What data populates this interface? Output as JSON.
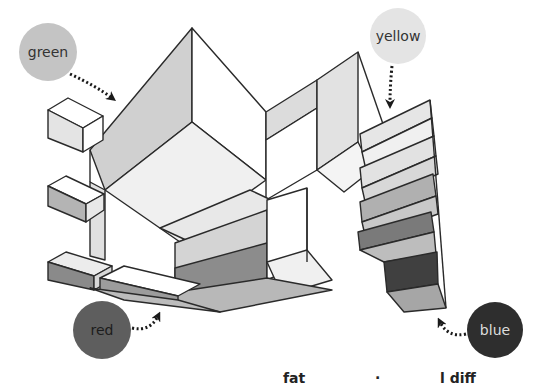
{
  "diagram": {
    "title": "",
    "style": "isometric grayscale block structure",
    "callouts": [
      {
        "id": "green",
        "label": "green",
        "x": 48,
        "y": 52,
        "r": 29,
        "fill": "#c4c4c4",
        "text_color": "#333333",
        "arrow_target": "large front face of main block"
      },
      {
        "id": "yellow",
        "label": "yellow",
        "x": 398,
        "y": 36,
        "r": 28,
        "fill": "#e4e4e4",
        "text_color": "#333333",
        "arrow_target": "top slabs of right staircase"
      },
      {
        "id": "red",
        "label": "red",
        "x": 102,
        "y": 330,
        "r": 29,
        "fill": "#5e5e5e",
        "text_color": "#1c1c1c",
        "arrow_target": "lower-left flat slabs"
      },
      {
        "id": "blue",
        "label": "blue",
        "x": 495,
        "y": 330,
        "r": 28,
        "fill": "#2e2e2e",
        "text_color": "#dddddd",
        "arrow_target": "bottom dark block of right staircase"
      }
    ],
    "colors": {
      "background": "#ffffff",
      "outline": "#2a2a2a",
      "face_white": "#ffffff",
      "face_light": "#ededed",
      "face_mid_light": "#d6d6d6",
      "face_mid": "#bcbcbc",
      "face_mid_dark": "#9a9a9a",
      "face_dark": "#747474",
      "face_darkest": "#444444"
    }
  },
  "bottom_text": {
    "fragments": [
      {
        "text": "fat",
        "x": 283
      },
      {
        "text": "·",
        "x": 375
      },
      {
        "text": "l  diff",
        "x": 440
      }
    ]
  }
}
